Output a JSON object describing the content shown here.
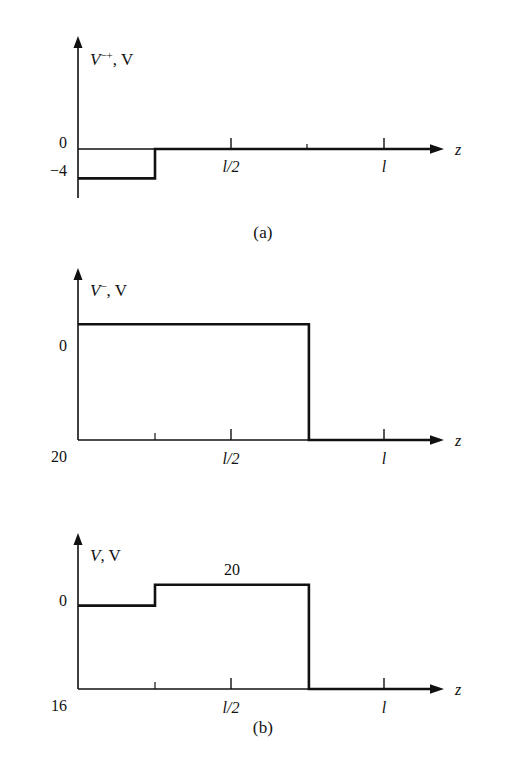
{
  "figure": {
    "background_color": "#ffffff",
    "line_color": "#111111"
  },
  "panels": [
    {
      "id": "a",
      "caption": "(a)",
      "yaxis_label_main": "V",
      "yaxis_label_sup": "−+",
      "yaxis_label_unit": ", V",
      "xaxis_label": "z",
      "y_labels": [
        "0",
        "−4"
      ],
      "x_tick_labels": [
        "l/2",
        "l"
      ]
    },
    {
      "id": "b",
      "caption": "(b)",
      "yaxis_label_main": "V",
      "yaxis_label_sup": "−",
      "yaxis_label_unit": ", V",
      "xaxis_label": "z",
      "y_labels": [
        "20",
        "0"
      ],
      "x_tick_labels": [
        "l/2",
        "l"
      ]
    },
    {
      "id": "c",
      "caption": "(c)",
      "yaxis_label_main": "V",
      "yaxis_label_sup": "",
      "yaxis_label_unit": ", V",
      "xaxis_label": "z",
      "y_labels": [
        "16",
        "0"
      ],
      "annotation": "20",
      "x_tick_labels": [
        "l/2",
        "l"
      ]
    }
  ],
  "chart_data": [
    {
      "type": "line",
      "panel": "a",
      "title": "(a)",
      "xlabel": "z",
      "ylabel": "V−+, V",
      "x": [
        0,
        0.25,
        0.25,
        1.15
      ],
      "values": [
        -4,
        -4,
        0,
        0
      ],
      "xlim": [
        0,
        1.15
      ],
      "ylim": [
        -6,
        8
      ],
      "x_ticks": [
        0.5,
        0.75,
        1.0
      ],
      "x_ticklabels": [
        "l/2",
        "",
        "l"
      ],
      "y_ticks": [
        0,
        -4
      ],
      "y_ticklabels": [
        "0",
        "−4"
      ],
      "grid": false,
      "legend": "none",
      "description": "Step waveform at −4 V from z=0 to z=l/4, then 0 V."
    },
    {
      "type": "line",
      "panel": "b",
      "title": "(b)",
      "xlabel": "z",
      "ylabel": "V−, V",
      "x": [
        0,
        0.75,
        0.75,
        1.15
      ],
      "values": [
        20,
        20,
        0,
        0
      ],
      "xlim": [
        0,
        1.15
      ],
      "ylim": [
        0,
        28
      ],
      "x_ticks": [
        0.25,
        0.5,
        0.75,
        1.0
      ],
      "x_ticklabels": [
        "",
        "l/2",
        "",
        "l"
      ],
      "y_ticks": [
        0,
        20
      ],
      "y_ticklabels": [
        "0",
        "20"
      ],
      "grid": false,
      "legend": "none",
      "description": "Rectangular pulse of 20 V from z=0 to z=3l/4, then 0 V."
    },
    {
      "type": "line",
      "panel": "c",
      "title": "(c)",
      "xlabel": "z",
      "ylabel": "V, V",
      "x": [
        0,
        0.25,
        0.25,
        0.75,
        0.75,
        1.15
      ],
      "values": [
        16,
        16,
        20,
        20,
        0,
        0
      ],
      "xlim": [
        0,
        1.15
      ],
      "ylim": [
        0,
        28
      ],
      "x_ticks": [
        0.25,
        0.5,
        0.75,
        1.0
      ],
      "x_ticklabels": [
        "",
        "l/2",
        "",
        "l"
      ],
      "y_ticks": [
        0,
        16
      ],
      "y_ticklabels": [
        "0",
        "16"
      ],
      "annotations": [
        {
          "text": "20",
          "x": 0.45,
          "y": 20
        }
      ],
      "grid": false,
      "legend": "none",
      "description": "Two-level staircase: 16 V from z=0 to z=l/4, 20 V from z=l/4 to z=3l/4, then 0 V."
    }
  ]
}
